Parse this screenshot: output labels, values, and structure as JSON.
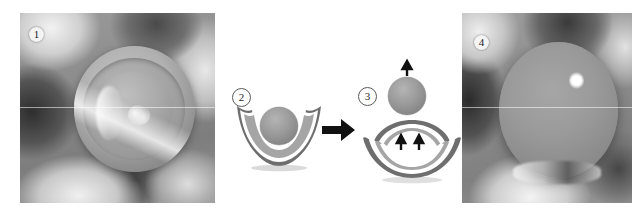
{
  "figure": {
    "kind": "four-panel-sequence",
    "background_color": "#ffffff",
    "width": 639,
    "height": 216
  },
  "panels": [
    {
      "id": "panel-1",
      "number": "1",
      "type": "photomicrograph",
      "label_style": "filled-circle",
      "description": "grayscale micrograph of concentric cup structure with central sphere before ejection"
    },
    {
      "id": "panel-2",
      "number": "2",
      "type": "schematic",
      "label_style": "outlined-circle",
      "description": "schematic of sphere resting inside concave cup membrane"
    },
    {
      "id": "panel-3",
      "number": "3",
      "type": "schematic",
      "label_style": "outlined-circle",
      "description": "schematic of membrane snapping upward launching the sphere"
    },
    {
      "id": "panel-4",
      "number": "4",
      "type": "photomicrograph",
      "label_style": "filled-circle",
      "description": "grayscale micrograph of large protruding droplet after ejection"
    }
  ],
  "arrows": {
    "transition": {
      "name": "right-arrow",
      "direction": "right",
      "color": "#111111"
    },
    "ejection": {
      "name": "up-arrow",
      "direction": "up",
      "color": "#111111",
      "count": 1
    },
    "membrane_thrust": {
      "name": "up-arrow",
      "direction": "up",
      "color": "#111111",
      "count": 2
    }
  },
  "colors": {
    "sphere_fill": "#9a9a9a",
    "sphere_edge": "#7f7f7f",
    "membrane_dark": "#6e6e6e",
    "membrane_mid": "#a5a5a5",
    "membrane_light": "#ffffff",
    "arrow": "#111111",
    "photo_base": "#8d8d8d"
  }
}
